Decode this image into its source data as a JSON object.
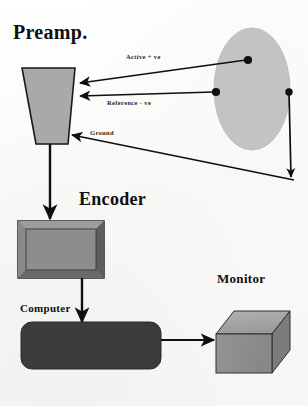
{
  "figure": {
    "type": "block-diagram",
    "background_color": "#fbfbfa",
    "ink_color": "#100f0d"
  },
  "headings": {
    "preamp": "Preamp.",
    "encoder": "Encoder",
    "computer": "Computer",
    "monitor": "Monitor"
  },
  "connection_labels": {
    "active": "Active + ve",
    "reference": "Reference   - ve",
    "ground": "Ground"
  },
  "shapes": {
    "preamp": {
      "name": "preamp-trapezoid",
      "fill": "#a8a8a8",
      "stroke": "#191916",
      "points": "22,68 75,68 68,144 36,144"
    },
    "head_ellipse": {
      "name": "head-ellipse",
      "fill": "#c3c3c3",
      "stroke": "#b0b0b0",
      "cx": 252,
      "cy": 89,
      "rx": 38,
      "ry": 61
    },
    "encoder": {
      "name": "encoder-box",
      "outer_fill": "#6f6f6f",
      "inner_fill": "#8b8b8b",
      "stroke": "#191916",
      "x": 18,
      "y": 221,
      "width": 86,
      "height": 57
    },
    "computer": {
      "name": "computer-rounded-rect",
      "fill": "#3b3b3b",
      "stroke": "#2a2a2a",
      "x": 21,
      "y": 322,
      "width": 140,
      "height": 47,
      "radius": 11
    },
    "monitor": {
      "name": "monitor-cube",
      "front_fill": "#8e8e8e",
      "top_fill": "#a3a3a3",
      "side_fill": "#7b7b7b",
      "stroke": "#2e2e2e",
      "x": 216,
      "y": 311,
      "width": 56,
      "height": 62,
      "depth": 18
    }
  },
  "electrodes": [
    {
      "name": "active-electrode-dot",
      "cx": 248,
      "cy": 60,
      "r": 4.0
    },
    {
      "name": "reference-electrode-dot",
      "cx": 216,
      "cy": 92,
      "r": 4.0
    },
    {
      "name": "ground-electrode-dot",
      "cx": 289,
      "cy": 92,
      "r": 3.6
    }
  ],
  "connections": [
    {
      "name": "active-signal-line",
      "from": "active-electrode-dot",
      "to": "preamp-trapezoid",
      "label": "Active + ve"
    },
    {
      "name": "reference-signal-line",
      "from": "reference-electrode-dot",
      "to": "preamp-trapezoid",
      "label": "Reference   - ve"
    },
    {
      "name": "ground-signal-line",
      "from": "preamp-trapezoid",
      "to": "ground-electrode-dot",
      "label": "Ground"
    },
    {
      "name": "preamp-to-encoder-arrow",
      "from": "preamp-trapezoid",
      "to": "encoder-box"
    },
    {
      "name": "encoder-to-computer-arrow",
      "from": "encoder-box",
      "to": "computer-rounded-rect"
    },
    {
      "name": "computer-to-monitor-arrow",
      "from": "computer-rounded-rect",
      "to": "monitor-cube"
    }
  ]
}
